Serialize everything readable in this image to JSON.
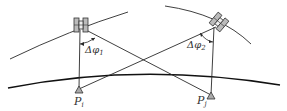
{
  "diagram": {
    "title": "",
    "labels": {
      "angle1": "Δφ",
      "angle1_sub": "1",
      "angle2": "Δφ",
      "angle2_sub": "2",
      "station_i": "P",
      "station_i_sub": "i",
      "station_j": "P",
      "station_j_sub": "j"
    },
    "colors": {
      "line": "#2a2a2a",
      "earth": "#111111",
      "background": "#ffffff"
    }
  }
}
